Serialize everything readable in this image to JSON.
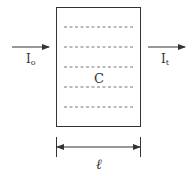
{
  "diagram": {
    "cell_label": "C",
    "incident_label": "I",
    "incident_subscript": "o",
    "transmitted_label": "I",
    "transmitted_subscript": "t",
    "path_length_label": "ℓ",
    "dashed_line_count": 5,
    "colors": {
      "stroke": "#333333",
      "dash": "#777777",
      "background": "#ffffff"
    }
  }
}
